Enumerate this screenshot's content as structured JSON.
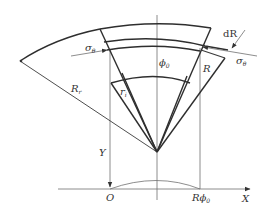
{
  "diagram": {
    "type": "geometry",
    "labels": {
      "sigma_left": "σ",
      "sigma_left_sub": "θ",
      "sigma_right": "σ",
      "sigma_right_sub": "θ",
      "dR": "dR",
      "phi0": "ϕ",
      "phi0_sub": "0",
      "R": "R",
      "R_r": "R",
      "R_r_sub": "r",
      "r_i": "r",
      "r_i_sub": "i",
      "Y": "Y",
      "O": "O",
      "R_phi0": "Rϕ",
      "R_phi0_sub": "0",
      "X": "X"
    },
    "colors": {
      "line": "#3a3a3a",
      "text": "#333333",
      "background": "#ffffff"
    }
  }
}
